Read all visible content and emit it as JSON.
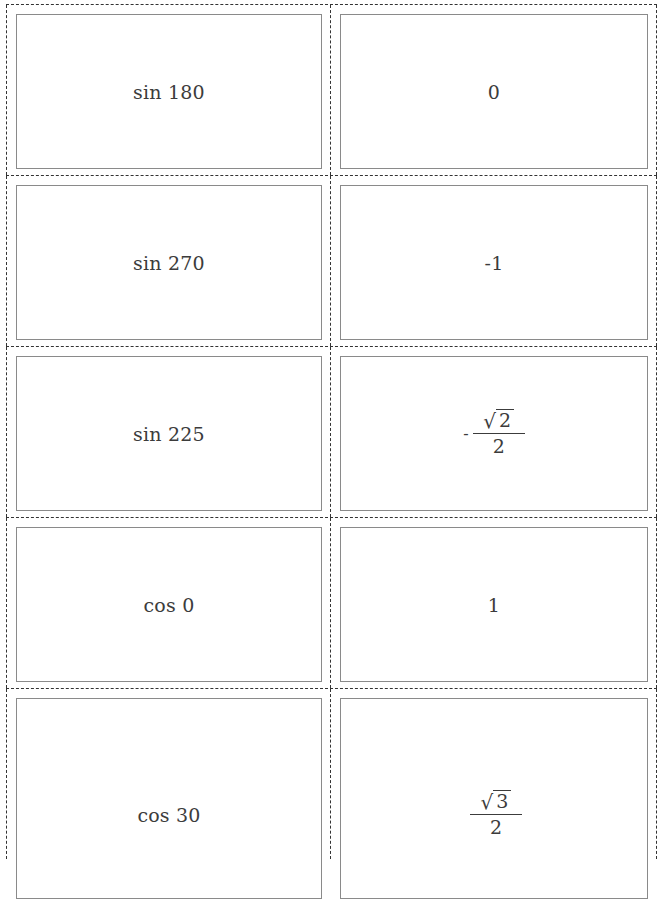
{
  "flashcards": [
    {
      "front": "sin 180",
      "back": {
        "type": "text",
        "value": "0"
      }
    },
    {
      "front": "sin 270",
      "back": {
        "type": "text",
        "value": "-1"
      }
    },
    {
      "front": "sin 225",
      "back": {
        "type": "fraction",
        "sign": "-",
        "radical": "√",
        "radicand": "2",
        "denominator": "2"
      }
    },
    {
      "front": "cos 0",
      "back": {
        "type": "text",
        "value": "1"
      }
    },
    {
      "front": "cos 30",
      "back": {
        "type": "fraction",
        "sign": "",
        "radical": "√",
        "radicand": "3",
        "denominator": "2"
      }
    }
  ],
  "colors": {
    "cut_line": "#333333",
    "card_border": "#8a8a8a",
    "text": "#3c3c3c"
  }
}
